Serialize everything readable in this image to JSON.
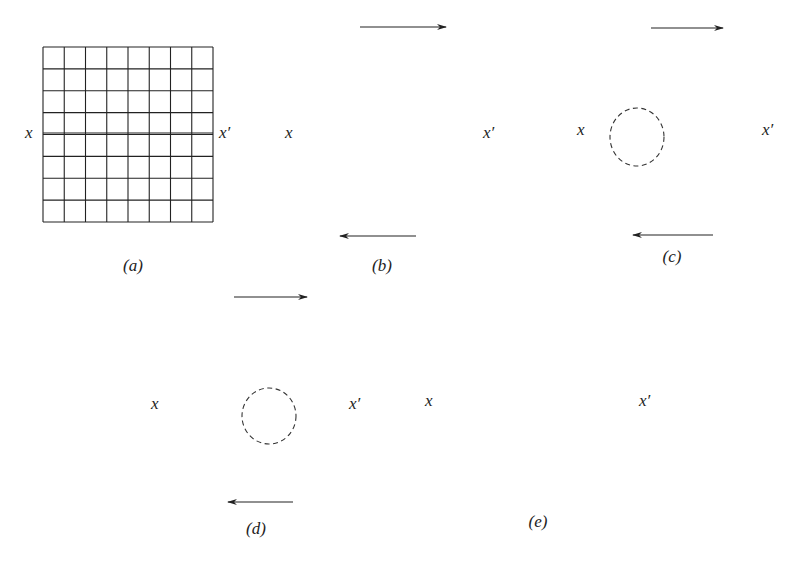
{
  "figure": {
    "line_color": "#222222",
    "dash_color": "#333333",
    "panels": [
      {
        "id": "a",
        "caption": "(a)",
        "left_label": "x",
        "right_label": "x′",
        "state": "undeformed lattice",
        "cols": 8,
        "rows": 8,
        "has_arrows": false,
        "has_circle": false
      },
      {
        "id": "b",
        "caption": "(b)",
        "left_label": "x",
        "right_label": "x′",
        "state": "elastic shear",
        "cols": 8,
        "rows": 8,
        "has_arrows": true,
        "has_circle": false
      },
      {
        "id": "c",
        "caption": "(c)",
        "left_label": "x",
        "right_label": "x′",
        "state": "dislocation nucleated at left",
        "cols": 7,
        "rows": 8,
        "has_arrows": true,
        "has_circle": true
      },
      {
        "id": "d",
        "caption": "(d)",
        "left_label": "x",
        "right_label": "x′",
        "state": "dislocation moving through crystal",
        "cols": 8,
        "rows": 8,
        "has_arrows": true,
        "has_circle": true
      },
      {
        "id": "e",
        "caption": "(e)",
        "left_label": "x",
        "right_label": "x′",
        "state": "slip complete by one lattice spacing",
        "cols": 8,
        "rows": 8,
        "has_arrows": false,
        "has_circle": false
      }
    ]
  }
}
